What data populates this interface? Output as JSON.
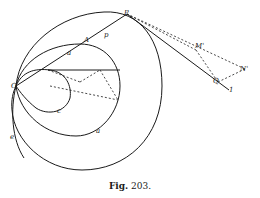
{
  "figure": {
    "caption_prefix": "Fig.",
    "caption_number": "203.",
    "stroke_color": "#1a1a1a",
    "background": "#ffffff"
  },
  "labels": {
    "O": "O",
    "P": "P",
    "A": "A",
    "p": "p",
    "a_on_line": "a",
    "c": "c",
    "a": "a",
    "e": "e",
    "M": "M'",
    "N": "N'",
    "Q": "Q",
    "one": "1"
  }
}
